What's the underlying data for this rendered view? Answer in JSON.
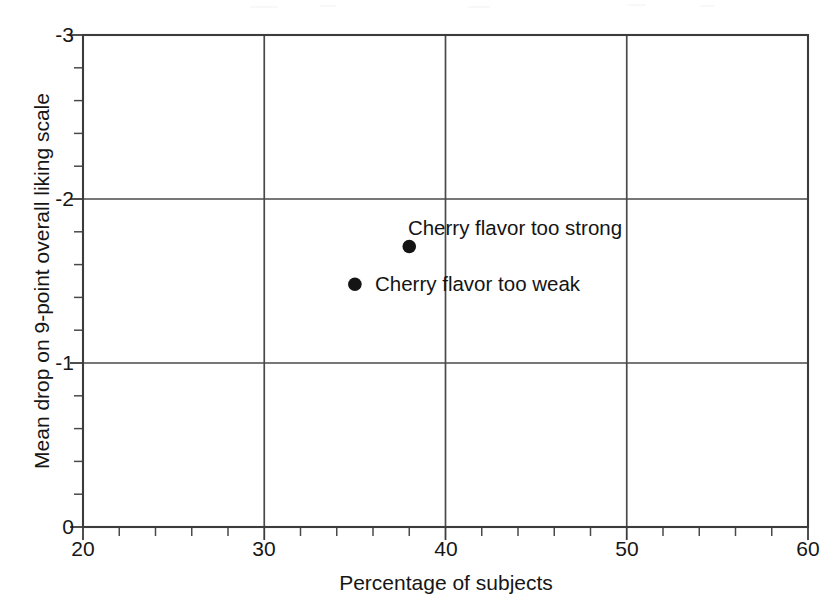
{
  "chart_data": {
    "type": "scatter",
    "title": "",
    "xlabel": "Percentage of subjects",
    "ylabel": "Mean drop on 9-point overall liking scale",
    "xlim": [
      20,
      60
    ],
    "ylim": [
      0,
      -3
    ],
    "y_inverted": true,
    "grid": true,
    "legend": "none",
    "x_major_ticks": [
      20,
      30,
      40,
      50,
      60
    ],
    "x_tick_labels": [
      "20",
      "30",
      "40",
      "50",
      "60"
    ],
    "x_minor_step": 2,
    "y_major_ticks": [
      -3,
      -2,
      -1,
      0
    ],
    "y_tick_labels": [
      "-3",
      "-2",
      "-1",
      "0"
    ],
    "y_minor_step": 0.2,
    "points": [
      {
        "label": "Cherry flavor too strong",
        "x": 38.0,
        "y": -1.71,
        "label_position": "above",
        "marker": "filled-circle"
      },
      {
        "label": "Cherry flavor too weak",
        "x": 35.0,
        "y": -1.48,
        "label_position": "right",
        "marker": "filled-circle"
      }
    ]
  },
  "colors": {
    "background": "#ffffff",
    "axis": "#3c3c3c",
    "grid": "#4a4a4a",
    "marker": "#141414",
    "text": "#161616"
  }
}
